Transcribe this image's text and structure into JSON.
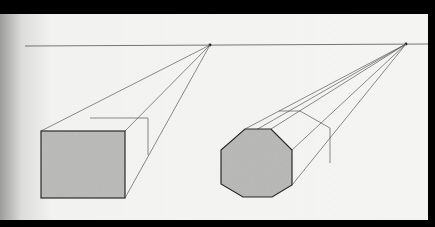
{
  "image": {
    "subject": "One-point perspective pencil drawing",
    "description": "Rectangular box and octagonal prism drawn in perspective, each converging to a vanishing point on a shared horizon line",
    "colors": {
      "paper": "#f2f2f0",
      "paper_shadow": "#a9a9a9",
      "frame": "#000000",
      "line": "#4a4a4a",
      "shading": "#b4b4b2",
      "outline": "#2b2b2b"
    },
    "horizon_line": {
      "y": 46,
      "x_start": 25,
      "x_end": 435
    },
    "vanishing_points": [
      {
        "name": "vp-left",
        "x": 210,
        "y": 45
      },
      {
        "name": "vp-right",
        "x": 406,
        "y": 44
      }
    ],
    "shapes": [
      {
        "name": "box",
        "front_face": "41,131 125,131 125,198 41,198",
        "back_top": "90,118 148,118",
        "back_right": "148,118 148,155"
      },
      {
        "name": "octagonal-prism",
        "front_face": "245,129 271,129 292,150 292,185 272,197 243,197 221,184 221,150",
        "back_face": "279,111 300,111 330,128 330,163"
      }
    ]
  }
}
